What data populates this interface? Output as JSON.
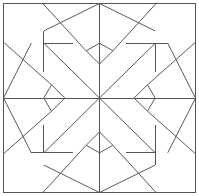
{
  "diagram": {
    "title": "",
    "type": "quilt-block-outline",
    "pattern": "eight-pointed star",
    "symmetry": "4-fold rotational and mirror",
    "line_color": "#555555",
    "background_color": "#ffffff"
  }
}
